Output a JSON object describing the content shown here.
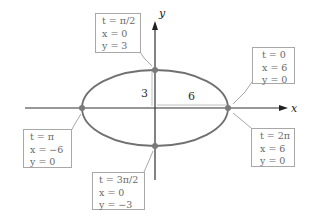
{
  "axes": {
    "x_label": "x",
    "y_label": "y"
  },
  "dimensions": {
    "semi_minor_label": "3",
    "semi_major_label": "6"
  },
  "colors": {
    "ellipse": "#707070",
    "axis": "#303030",
    "point": "#7a7a7a",
    "box_border": "#a8a8a8",
    "box_text": "#6a6a6a",
    "leader": "#a8a8a8"
  },
  "points": [
    {
      "id": "top",
      "lines": [
        "t = π/2",
        "x = 0",
        "y = 3"
      ]
    },
    {
      "id": "right-start",
      "lines": [
        "t = 0",
        "x = 6",
        "y = 0"
      ]
    },
    {
      "id": "left",
      "lines": [
        "t = π",
        "x = −6",
        "y = 0"
      ]
    },
    {
      "id": "bottom",
      "lines": [
        "t = 3π/2",
        "x = 0",
        "y = −3"
      ]
    },
    {
      "id": "right-end",
      "lines": [
        "t = 2π",
        "x = 6",
        "y = 0"
      ]
    }
  ]
}
